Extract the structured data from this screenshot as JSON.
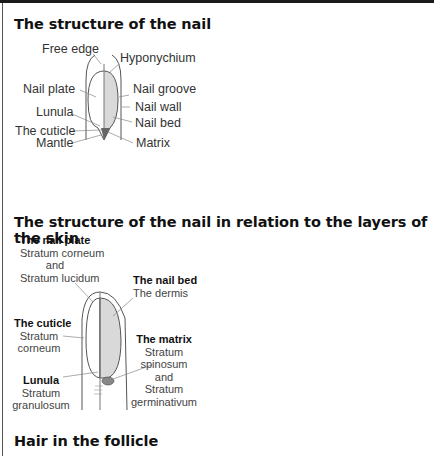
{
  "sections": [
    {
      "title": "The structure of the nail",
      "labels": {
        "free_edge": "Free edge",
        "hyponychium": "Hyponychium",
        "nail_plate": "Nail plate",
        "nail_groove": "Nail groove",
        "nail_wall": "Nail wall",
        "lunula": "Lunula",
        "nail_bed": "Nail bed",
        "cuticle": "The cuticle",
        "mantle": "Mantle",
        "matrix": "Matrix"
      }
    },
    {
      "title": "The structure of the nail in relation to the layers of the skin",
      "labels": {
        "nail_plate": {
          "heading": "The nail plate",
          "lines": [
            "Stratum corneum",
            "and",
            "Stratum lucidum"
          ]
        },
        "nail_bed": {
          "heading": "The nail bed",
          "lines": [
            "The dermis"
          ]
        },
        "cuticle": {
          "heading": "The cuticle",
          "lines": [
            "Stratum",
            "corneum"
          ]
        },
        "matrix": {
          "heading": "The matrix",
          "lines": [
            "Stratum",
            "spinosum",
            "and",
            "Stratum",
            "germinativum"
          ]
        },
        "lunula": {
          "heading": "Lunula",
          "lines": [
            "Stratum",
            "granulosum"
          ]
        }
      }
    },
    {
      "title": "Hair in the follicle"
    }
  ],
  "colors": {
    "nail_fill": "#d9d9d9",
    "line": "#555555"
  }
}
